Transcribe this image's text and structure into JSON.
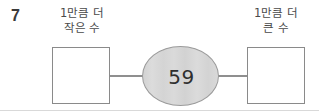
{
  "worksheet": {
    "problem_number": "7",
    "left": {
      "label_line1": "1만큼 더",
      "label_line2": "작은 수",
      "answer_value": ""
    },
    "center": {
      "value": "59",
      "shape": "ellipse",
      "fill_color": "#d6d6d6",
      "stroke_color": "#9a9a9a"
    },
    "right": {
      "label_line1": "1만큼 더",
      "label_line2": "큰 수",
      "answer_value": ""
    },
    "colors": {
      "box_border": "#8a8a8a",
      "connector": "#8f8f8f",
      "text": "#4a4a4a",
      "number_text": "#3a3a3a",
      "background": "#ffffff",
      "bottom_rule": "#d9d9d9"
    }
  }
}
